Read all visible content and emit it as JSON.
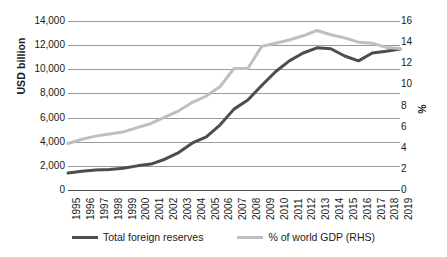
{
  "chart_data": {
    "type": "line",
    "title": "",
    "xlabel": "",
    "ylabel": "USD billion",
    "y2label": "%",
    "grid": true,
    "legend_position": "bottom",
    "ylim": [
      0,
      14000
    ],
    "ytick_step": 2000,
    "y2lim": [
      0,
      16
    ],
    "y2tick_step": 2,
    "categories": [
      "1995",
      "1996",
      "1997",
      "1998",
      "1999",
      "2000",
      "2001",
      "2002",
      "2003",
      "2004",
      "2005",
      "2006",
      "2007",
      "2008",
      "2009",
      "2010",
      "2011",
      "2012",
      "2013",
      "2014",
      "2015",
      "2016",
      "2017",
      "2018",
      "2019"
    ],
    "yticks_left": [
      "0",
      "2,000",
      "4,000",
      "6,000",
      "8,000",
      "10,000",
      "12,000",
      "14,000"
    ],
    "yticks_right": [
      "0",
      "2",
      "4",
      "6",
      "8",
      "10",
      "12",
      "14",
      "16"
    ],
    "series": [
      {
        "name": "Total foreign reserves",
        "axis": "left",
        "color": "#4d4d4d",
        "width": 3.0,
        "values": [
          1400,
          1550,
          1650,
          1700,
          1800,
          2000,
          2150,
          2550,
          3100,
          3900,
          4400,
          5400,
          6700,
          7450,
          8650,
          9800,
          10700,
          11350,
          11780,
          11700,
          11100,
          10700,
          11350,
          11500,
          11680
        ]
      },
      {
        "name": "% of world GDP (RHS)",
        "axis": "right",
        "color": "#bfbfbf",
        "width": 3.0,
        "values": [
          4.4,
          4.8,
          5.1,
          5.3,
          5.5,
          5.9,
          6.3,
          6.9,
          7.5,
          8.3,
          8.9,
          9.8,
          11.5,
          11.5,
          13.6,
          13.9,
          14.2,
          14.6,
          15.1,
          14.7,
          14.4,
          14.0,
          13.9,
          13.5,
          13.4
        ]
      }
    ]
  },
  "axes": {
    "left_title": "USD billion",
    "right_title": "%"
  },
  "legend": {
    "items": [
      {
        "label": "Total foreign reserves",
        "color": "#4d4d4d"
      },
      {
        "label": "% of world GDP (RHS)",
        "color": "#bfbfbf"
      }
    ]
  }
}
